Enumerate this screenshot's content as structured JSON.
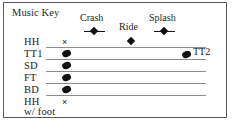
{
  "panel": {
    "title": "Music Key",
    "border_color": "#5a5a5a",
    "background": "#ffffff",
    "ink_color": "#111111",
    "staff_line_color": "#8d8d8d"
  },
  "cymbals": [
    {
      "label": "Crash",
      "notehead": "diamond-with-bar",
      "x": 94,
      "label_x": 80,
      "label_y": 16,
      "note_y": 34
    },
    {
      "label": "Ride",
      "notehead": "diamond",
      "x": 131,
      "label_x": 119,
      "label_y": 24,
      "note_y": 42
    },
    {
      "label": "Splash",
      "notehead": "diamond-with-bar",
      "x": 164,
      "label_x": 149,
      "label_y": 16,
      "note_y": 34
    }
  ],
  "staff_rows": [
    {
      "label": "HH",
      "notehead": "x-notehead",
      "line": false,
      "note_x": 66,
      "line_x1": 46,
      "line_x2": 206,
      "y": 44
    },
    {
      "label": "TT1",
      "notehead": "drum-oval",
      "line": true,
      "note_x": 66,
      "line_x1": 46,
      "line_x2": 206,
      "y": 56
    },
    {
      "label": "SD",
      "notehead": "drum-oval",
      "line": true,
      "note_x": 66,
      "line_x1": 46,
      "line_x2": 206,
      "y": 68
    },
    {
      "label": "FT",
      "notehead": "drum-oval",
      "line": true,
      "note_x": 66,
      "line_x1": 46,
      "line_x2": 206,
      "y": 80
    },
    {
      "label": "BD",
      "notehead": "drum-oval",
      "line": true,
      "note_x": 66,
      "line_x1": 46,
      "line_x2": 206,
      "y": 92
    },
    {
      "label": "HH",
      "notehead": "x-notehead",
      "line": true,
      "note_x": 66,
      "line_x1": 46,
      "line_x2": 206,
      "y": 104
    }
  ],
  "extra_labels": {
    "tt2": "TT2",
    "hh_w_foot_line2": "w/ foot"
  },
  "glyphs": {
    "x_notehead": "×"
  }
}
